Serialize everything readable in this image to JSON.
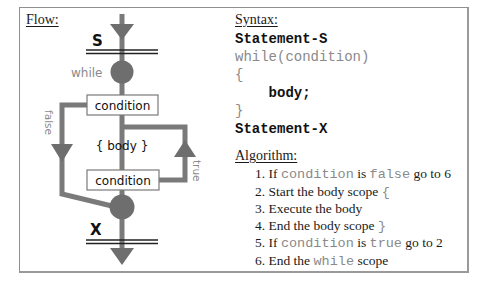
{
  "flow": {
    "heading": "Flow:",
    "start_label": "S",
    "end_label": "X",
    "while_label": "while",
    "condition_top": "condition",
    "body_label": "{ body }",
    "condition_bottom": "condition",
    "false_label": "false",
    "true_label": "true",
    "colors": {
      "line": "#7a7a7a",
      "node": "#6e6e6e",
      "box_border": "#7a7a7a",
      "text": "#111111",
      "label_gray": "#8a8a8a"
    }
  },
  "syntax": {
    "heading": "Syntax:",
    "lines": [
      {
        "text": "Statement-S",
        "style": "bold"
      },
      {
        "text": "while(condition)",
        "style": "gray"
      },
      {
        "text": "{",
        "style": "gray"
      },
      {
        "text": "    body;",
        "style": "bold"
      },
      {
        "text": "}",
        "style": "gray"
      },
      {
        "text": "Statement-X",
        "style": "bold"
      }
    ]
  },
  "algorithm": {
    "heading": "Algorithm:",
    "steps": [
      {
        "num": "1.",
        "pre": "If ",
        "code1": "condition",
        "mid": " is ",
        "code2": "false",
        "post": " go to 6"
      },
      {
        "num": "2.",
        "pre": "Start the body scope ",
        "code1": "{"
      },
      {
        "num": "3.",
        "pre": "Execute the body"
      },
      {
        "num": "4.",
        "pre": "End the body scope ",
        "code1": "}"
      },
      {
        "num": "5.",
        "pre": "If ",
        "code1": "condition",
        "mid": " is ",
        "code2": "true",
        "post": " go to 2"
      },
      {
        "num": "6.",
        "pre": "End the ",
        "code1": "while",
        "post": " scope"
      }
    ]
  }
}
